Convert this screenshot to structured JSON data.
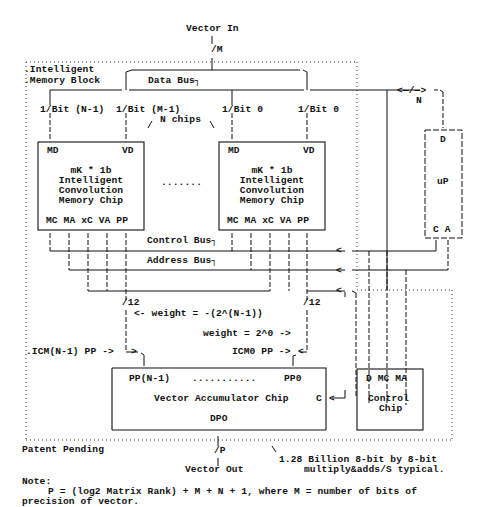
{
  "diagram": {
    "top": {
      "input_label": "Vector In",
      "input_width": "/M"
    },
    "block": {
      "label_line1": ".Intelligent",
      "label_line2": ".Memory Block"
    },
    "buses": {
      "data_bus": "Data Bus┐",
      "control_bus": "Control Bus┐",
      "address_bus": "Address Bus┐",
      "uP_link_width": "N",
      "uP_link_arrows": "<—/—>"
    },
    "bit_labels": [
      "1/Bit (N-1)",
      "1/Bit (M-1)",
      "1/Bit 0",
      "1/Bit 0"
    ],
    "chips_count_label": "N chips",
    "chip_left": {
      "top_left": "MD",
      "top_right": "VD",
      "title_lines": [
        "mK * 1b",
        "Intelligent",
        "Convolution",
        "Memory Chip"
      ],
      "pins": "MC MA xC VA PP"
    },
    "chip_right": {
      "top_left": "MD",
      "top_right": "VD",
      "title_lines": [
        "mK * 1b",
        "Intelligent",
        "Convolution",
        "Memory Chip"
      ],
      "pins": "MC MA xC VA PP"
    },
    "ellipsis": ".......",
    "microprocessor": {
      "top": "D",
      "name": "uP",
      "bottom": "C A"
    },
    "pp_widths": [
      "/12",
      "/12"
    ],
    "weights": {
      "msb": "<- weight = -(2^(N-1))",
      "lsb": "weight = 2^0 ->"
    },
    "icm_labels": {
      "msb": ".ICM(N-1) PP ->",
      "lsb": "ICM0 PP ->"
    },
    "accumulator": {
      "top_left": "PP(N-1)",
      "top_dots": "...........",
      "top_right": "PP0",
      "name": "Vector Accumulator Chip",
      "output": "DPO",
      "control_pin": "C"
    },
    "control_chip": {
      "pins": "D MC MA",
      "name_line1": "Control",
      "name_line2": "Chip"
    },
    "bottom": {
      "patent": "Patent Pending",
      "output_width": "/P",
      "output_label": "Vector Out",
      "perf_line1": "1.28 Billion 8-bit by 8-bit",
      "perf_line2": "multiply&adds/S typical."
    },
    "note": {
      "title": "Note:",
      "line1": "P = (log2 Matrix Rank) + M + N + 1, where M = number of bits of",
      "line2": "precision of vector."
    }
  }
}
